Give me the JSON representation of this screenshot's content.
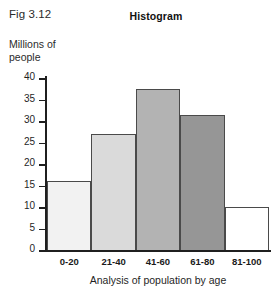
{
  "figure": {
    "label": "Fig 3.12",
    "title": "Histogram"
  },
  "axes": {
    "ylabel": "Millions of\npeople",
    "ylabel_line1": "Millions of",
    "ylabel_line2": "people",
    "xlabel": "Analysis of population by age",
    "yticks": [
      0,
      5,
      10,
      15,
      20,
      25,
      30,
      35,
      40
    ],
    "ytick_labels": [
      "0",
      "5",
      "10",
      "15",
      "20",
      "25",
      "30",
      "35",
      "40"
    ]
  },
  "bar_colors": [
    "#f2f2f2",
    "#dadada",
    "#b3b3b3",
    "#969696",
    "#ffffff"
  ],
  "bar_border_color": "#4a4a4a",
  "axis_color": "#1f1f1f",
  "chart_data": {
    "type": "bar",
    "title": "Histogram",
    "xlabel": "Analysis of population by age",
    "ylabel": "Millions of people",
    "categories": [
      "0-20",
      "21-40",
      "41-60",
      "61-80",
      "81-100"
    ],
    "values": [
      16,
      27,
      37.5,
      31.5,
      10
    ],
    "ylim": [
      0,
      40
    ],
    "ytick_step": 5,
    "grid": false,
    "legend": "none",
    "bar_gap": 0
  }
}
